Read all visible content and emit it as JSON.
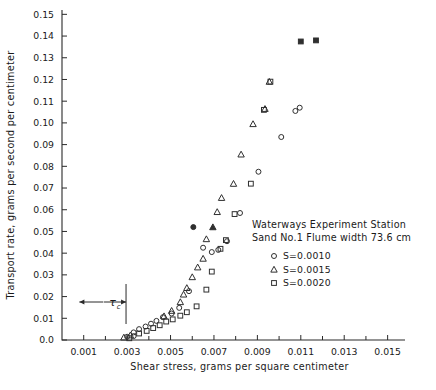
{
  "chart_data": {
    "type": "scatter",
    "title": "",
    "xlabel": "Shear stress, grams per square centimeter",
    "ylabel": "Transport rate, grams per second per centimeter",
    "xlim": [
      0.0,
      0.0158
    ],
    "ylim": [
      0.0,
      0.152
    ],
    "grid": false,
    "legend_position": "center-right",
    "xticks": [
      0.001,
      0.003,
      0.005,
      0.007,
      0.009,
      0.011,
      0.013,
      0.015
    ],
    "xtick_labels": [
      "0.001",
      "0.003",
      "0.005",
      "0.007",
      "0.009",
      "0.011",
      "0.013",
      "0.015"
    ],
    "xminor_ticks": [
      0.002,
      0.004,
      0.006,
      0.008,
      0.01,
      0.012,
      0.014
    ],
    "yticks": [
      0.0,
      0.01,
      0.02,
      0.03,
      0.04,
      0.05,
      0.06,
      0.07,
      0.08,
      0.09,
      0.1,
      0.11,
      0.12,
      0.13,
      0.14,
      0.15
    ],
    "ytick_labels": [
      "0.0",
      "0.01",
      "0.02",
      "0.03",
      "0.04",
      "0.05",
      "0.06",
      "0.07",
      "0.08",
      "0.09",
      "0.10",
      "0.11",
      "0.12",
      "0.13",
      "0.14",
      "0.15"
    ],
    "annotations": [
      {
        "name": "critical-shear-stress",
        "text": "τ",
        "subscript": "c",
        "x_from": 0.0008,
        "x_to": 0.00295,
        "y": 0.0175,
        "style": "double-arrow-with-end-bar"
      }
    ],
    "series": [
      {
        "name": "S=0.0010",
        "marker": "circle",
        "points": [
          [
            0.003,
            0.0015
          ],
          [
            0.0033,
            0.0035
          ],
          [
            0.00355,
            0.005
          ],
          [
            0.00385,
            0.0062
          ],
          [
            0.0041,
            0.0075
          ],
          [
            0.00435,
            0.0088
          ],
          [
            0.00465,
            0.0105
          ],
          [
            0.0033,
            0.0018
          ],
          [
            0.00505,
            0.0122
          ],
          [
            0.0054,
            0.0148
          ],
          [
            0.00585,
            0.0225
          ],
          [
            0.00605,
            0.052
          ],
          [
            0.0065,
            0.0425
          ],
          [
            0.0069,
            0.0405
          ],
          [
            0.0072,
            0.0415
          ],
          [
            0.0076,
            0.0455
          ],
          [
            0.0082,
            0.0585
          ],
          [
            0.00905,
            0.0775
          ],
          [
            0.0101,
            0.0935
          ],
          [
            0.01075,
            0.1055
          ],
          [
            0.01095,
            0.107
          ]
        ]
      },
      {
        "name": "S=0.0015",
        "marker": "triangle",
        "points": [
          [
            0.00285,
            0.0012
          ],
          [
            0.00315,
            0.0022
          ],
          [
            0.0047,
            0.011
          ],
          [
            0.00505,
            0.0135
          ],
          [
            0.00545,
            0.0175
          ],
          [
            0.0056,
            0.021
          ],
          [
            0.00575,
            0.024
          ],
          [
            0.006,
            0.029
          ],
          [
            0.00625,
            0.0335
          ],
          [
            0.0065,
            0.0375
          ],
          [
            0.00665,
            0.0465
          ],
          [
            0.00695,
            0.052
          ],
          [
            0.00715,
            0.059
          ],
          [
            0.00735,
            0.0655
          ],
          [
            0.0079,
            0.072
          ],
          [
            0.00825,
            0.0855
          ],
          [
            0.0088,
            0.0995
          ],
          [
            0.00935,
            0.1065
          ],
          [
            0.00955,
            0.119
          ]
        ]
      },
      {
        "name": "S=0.0020",
        "marker": "square",
        "points": [
          [
            0.0031,
            0.0008
          ],
          [
            0.00355,
            0.003
          ],
          [
            0.0039,
            0.0042
          ],
          [
            0.0042,
            0.0055
          ],
          [
            0.0045,
            0.0068
          ],
          [
            0.0048,
            0.0085
          ],
          [
            0.0051,
            0.0095
          ],
          [
            0.00545,
            0.0112
          ],
          [
            0.00575,
            0.0128
          ],
          [
            0.0062,
            0.0155
          ],
          [
            0.00665,
            0.0232
          ],
          [
            0.0069,
            0.0315
          ],
          [
            0.0073,
            0.042
          ],
          [
            0.00755,
            0.046
          ],
          [
            0.00795,
            0.058
          ],
          [
            0.0087,
            0.072
          ],
          [
            0.0093,
            0.106
          ],
          [
            0.0096,
            0.119
          ],
          [
            0.011,
            0.1375
          ],
          [
            0.0117,
            0.138
          ]
        ]
      }
    ]
  },
  "legend": {
    "line1": "Waterways Experiment Station",
    "line2": "Sand No.1   Flume width 73.6 cm",
    "entries": [
      {
        "marker": "circle",
        "label": "S=0.0010"
      },
      {
        "marker": "triangle",
        "label": "S=0.0015"
      },
      {
        "marker": "square",
        "label": "S=0.0020"
      }
    ]
  }
}
